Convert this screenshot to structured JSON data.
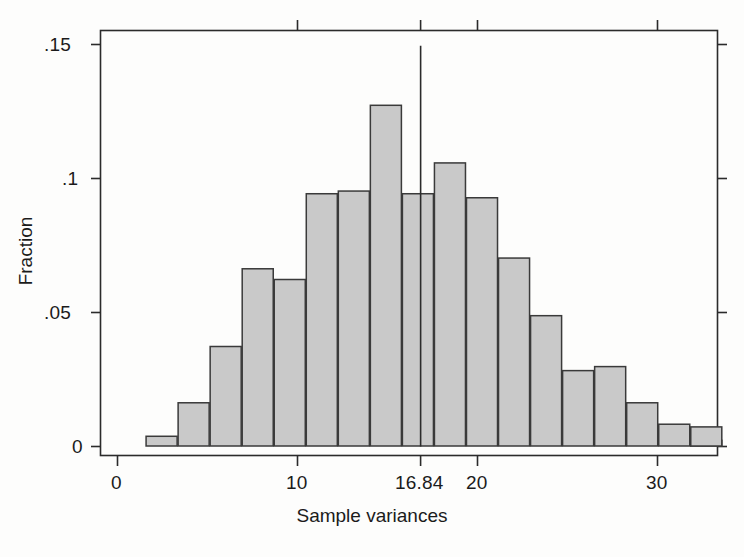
{
  "chart_data": {
    "type": "bar",
    "title": "",
    "xlabel": "Sample variances",
    "ylabel": "Fraction",
    "xlim": [
      0.0,
      33.4
    ],
    "ylim": [
      0.0,
      0.1565
    ],
    "xticks": [
      0,
      10,
      16.84,
      20,
      30
    ],
    "xtick_labels": [
      "0",
      "10",
      "16.84",
      "20",
      "30"
    ],
    "yticks": [
      0,
      0.05,
      0.1,
      0.15
    ],
    "ytick_labels": [
      "0",
      ".05",
      ".1",
      ".15"
    ],
    "grid": false,
    "legend": null,
    "bin_width": 1.78,
    "bin_starts": [
      1.56,
      3.34,
      5.12,
      6.9,
      8.68,
      10.46,
      12.24,
      14.02,
      15.8,
      17.58,
      19.36,
      21.14,
      22.92,
      24.7,
      26.48,
      28.26,
      30.04,
      31.82
    ],
    "values": [
      0.004,
      0.0165,
      0.0375,
      0.0665,
      0.0625,
      0.0945,
      0.0955,
      0.1275,
      0.0945,
      0.106,
      0.093,
      0.0705,
      0.049,
      0.0285,
      0.03,
      0.0165,
      0.0085,
      0.0025
    ],
    "extra_bar": {
      "start": 31.82,
      "width": 1.78,
      "value": 0.0075
    },
    "annotations": [
      {
        "name": "reference-line",
        "type": "vline",
        "x": 16.84,
        "label": "16.84",
        "y_top": 0.1495
      }
    ],
    "bar_fill": "#c9c9c9",
    "bar_stroke": "#3a3a3a",
    "axis_color": "#2b2b2b"
  },
  "axis": {
    "x_title": "Sample variances",
    "y_title": "Fraction",
    "x_tick_0": "0",
    "x_tick_10": "10",
    "x_tick_1684": "16.84",
    "x_tick_20": "20",
    "x_tick_30": "30",
    "y_tick_0": "0",
    "y_tick_05": ".05",
    "y_tick_1": ".1",
    "y_tick_15": ".15"
  }
}
